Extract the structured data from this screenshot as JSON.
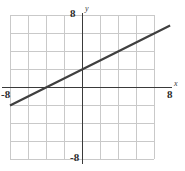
{
  "figure": {
    "kind": "coordinate-plane-line-graph",
    "background_color": "#ffffff"
  },
  "axes": {
    "x_name": "x",
    "y_name": "y",
    "x_min_label": "-8",
    "x_max_label": "8",
    "y_min_label": "-8",
    "y_max_label": "8",
    "axis_color": "#3a3a3a",
    "grid_color": "#c9c9c9"
  },
  "chart_data": {
    "type": "line",
    "title": "",
    "xlabel": "x",
    "ylabel": "y",
    "xlim": [
      -8,
      8
    ],
    "ylim": [
      -8,
      8
    ],
    "xticks": [
      -8,
      -6,
      -4,
      -2,
      0,
      2,
      4,
      6,
      8
    ],
    "yticks": [
      -8,
      -6,
      -4,
      -2,
      0,
      2,
      4,
      6,
      8
    ],
    "tick_labels_shown": [
      "-8",
      "8"
    ],
    "grid": true,
    "grid_step": 2,
    "legend": null,
    "series": [
      {
        "name": "line",
        "color": "#3f3f3f",
        "slope": 0.5,
        "intercept": 2,
        "equation": "y = 0.5x + 2",
        "x_intercept": -4,
        "y_intercept": 2,
        "x": [
          -8,
          8
        ],
        "values": [
          -2,
          6
        ],
        "points": [
          [
            -8,
            -2
          ],
          [
            -4,
            0
          ],
          [
            0,
            2
          ],
          [
            4,
            4
          ],
          [
            8,
            6
          ]
        ]
      }
    ]
  }
}
